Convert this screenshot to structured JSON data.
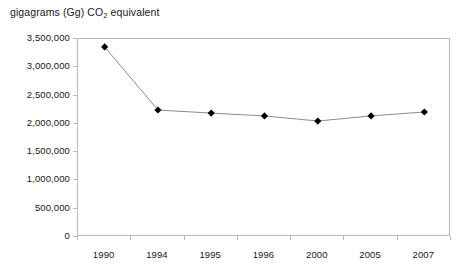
{
  "chart_data": {
    "type": "line",
    "title": "",
    "ylabel_caption_prefix": "gigagrams (Gg) CO",
    "ylabel_caption_sub": "2",
    "ylabel_caption_suffix": " equivalent",
    "xlabel": "",
    "ylabel": "gigagrams (Gg) CO2 equivalent",
    "categories": [
      "1990",
      "1994",
      "1995",
      "1996",
      "2000",
      "2005",
      "2007"
    ],
    "values": [
      3360000,
      2245000,
      2190000,
      2140000,
      2050000,
      2140000,
      2210000
    ],
    "series": [
      {
        "name": "CO2 equivalent emissions",
        "values": [
          3360000,
          2245000,
          2190000,
          2140000,
          2050000,
          2140000,
          2210000
        ]
      }
    ],
    "ylim": [
      0,
      3500000
    ],
    "ytick_values": [
      0,
      500000,
      1000000,
      1500000,
      2000000,
      2500000,
      3000000,
      3500000
    ],
    "ytick_labels": [
      "0",
      "500,000",
      "1,000,000",
      "1,500,000",
      "2,000,000",
      "2,500,000",
      "3,000,000",
      "3,500,000"
    ],
    "grid": false,
    "legend": "none",
    "marker": "diamond",
    "marker_color": "#000000",
    "line_color": "#8c8c8c",
    "axis_color": "#b9b9b9",
    "plot_background": "#ffffff"
  }
}
